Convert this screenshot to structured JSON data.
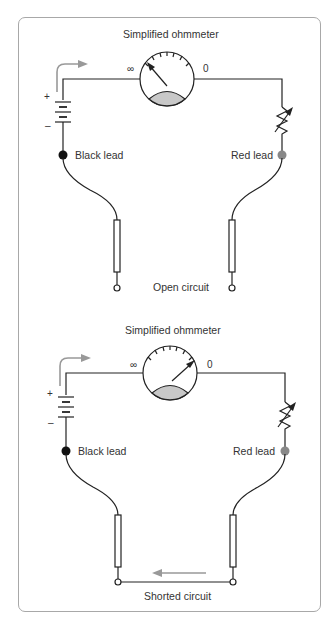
{
  "figure": {
    "panels": [
      {
        "id": "open",
        "meter_title": "Simplified ohmmeter",
        "scale_left": "∞",
        "scale_right": "0",
        "battery_plus": "+",
        "battery_minus": "–",
        "black_lead": "Black lead",
        "red_lead": "Red lead",
        "caption": "Open circuit",
        "needle_position": "infinity"
      },
      {
        "id": "shorted",
        "meter_title": "Simplified ohmmeter",
        "scale_left": "∞",
        "scale_right": "0",
        "battery_plus": "+",
        "battery_minus": "–",
        "black_lead": "Black lead",
        "red_lead": "Red lead",
        "caption": "Shorted circuit",
        "needle_position": "zero"
      }
    ],
    "colors": {
      "line": "#222222",
      "arrow": "#999999",
      "meter_fill": "#c8c8c8",
      "black_lead": "#111111",
      "red_lead": "#888888",
      "border": "#a8a8a8"
    }
  }
}
